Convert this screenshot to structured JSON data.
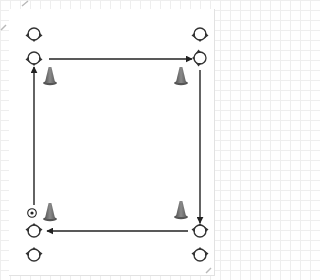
{
  "diagram": {
    "type": "soccer-drill-square",
    "colors": {
      "line": "#222222",
      "player_outline": "#333333",
      "cone": "#7a7a7a",
      "cone_dark": "#555555",
      "ball": "#222222",
      "grid": "#eeeeee"
    },
    "players": [
      {
        "id": "tl-back",
        "x": 34,
        "y": 34,
        "orientation": "down"
      },
      {
        "id": "tl-front",
        "x": 34,
        "y": 58,
        "orientation": "down"
      },
      {
        "id": "tr-back",
        "x": 200,
        "y": 34,
        "orientation": "down"
      },
      {
        "id": "tr-front",
        "x": 200,
        "y": 58,
        "orientation": "left"
      },
      {
        "id": "bl-front",
        "x": 34,
        "y": 231,
        "orientation": "up"
      },
      {
        "id": "bl-back",
        "x": 34,
        "y": 255,
        "orientation": "up"
      },
      {
        "id": "br-front",
        "x": 200,
        "y": 231,
        "orientation": "up"
      },
      {
        "id": "br-back",
        "x": 200,
        "y": 255,
        "orientation": "up"
      }
    ],
    "cones": [
      {
        "id": "cone-tl",
        "x": 50,
        "y": 76
      },
      {
        "id": "cone-tr",
        "x": 181,
        "y": 76
      },
      {
        "id": "cone-bl",
        "x": 50,
        "y": 212
      },
      {
        "id": "cone-br",
        "x": 181,
        "y": 210
      }
    ],
    "ball": {
      "x": 32,
      "y": 213
    },
    "arrows": [
      {
        "id": "arrow-top",
        "from": [
          49,
          59
        ],
        "to": [
          192,
          59
        ],
        "direction": "right"
      },
      {
        "id": "arrow-right",
        "from": [
          200,
          70
        ],
        "to": [
          200,
          223
        ],
        "direction": "down"
      },
      {
        "id": "arrow-bottom",
        "from": [
          188,
          231
        ],
        "to": [
          47,
          231
        ],
        "direction": "left"
      },
      {
        "id": "arrow-left",
        "from": [
          34,
          205
        ],
        "to": [
          34,
          67
        ],
        "direction": "up"
      }
    ]
  }
}
